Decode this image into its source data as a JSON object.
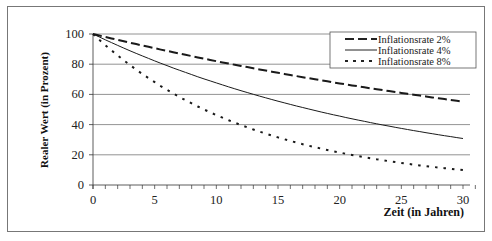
{
  "chart_data": {
    "type": "line",
    "title": "",
    "xlabel": "Zeit (in Jahren)",
    "ylabel": "Realer Wert (in Prozent)",
    "xlim": [
      0,
      30
    ],
    "ylim": [
      0,
      100
    ],
    "xticks": [
      0,
      5,
      10,
      15,
      20,
      25,
      30
    ],
    "yticks": [
      0,
      20,
      40,
      60,
      80,
      100
    ],
    "grid": "horizontal",
    "legend_position": "top-right",
    "x": [
      0,
      5,
      10,
      15,
      20,
      25,
      30
    ],
    "series": [
      {
        "name": "Inflationsrate 2%",
        "style": "dashed",
        "values": [
          100,
          90.6,
          82.0,
          74.3,
          67.3,
          61.0,
          55.2
        ]
      },
      {
        "name": "Inflationsrate 4%",
        "style": "solid",
        "values": [
          100,
          82.2,
          67.6,
          55.5,
          45.6,
          37.5,
          30.8
        ]
      },
      {
        "name": "Inflationsrate 8%",
        "style": "dotted",
        "values": [
          100,
          68.1,
          46.3,
          31.5,
          21.5,
          14.6,
          9.9
        ]
      }
    ]
  },
  "legend": {
    "items": [
      "Inflationsrate 2%",
      "Inflationsrate 4%",
      "Inflationsrate 8%"
    ]
  },
  "axes": {
    "xlabel": "Zeit (in Jahren)",
    "ylabel": "Realer Wert (in Prozent)",
    "yticks": [
      "0",
      "20",
      "40",
      "60",
      "80",
      "100"
    ],
    "xticks": [
      "0",
      "5",
      "10",
      "15",
      "20",
      "25",
      "30"
    ]
  }
}
